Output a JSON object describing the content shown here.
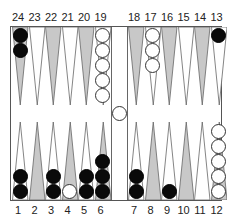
{
  "game": "Backgammon",
  "colors": {
    "light_point": "#ffffff",
    "dark_point": "#c8c8c8",
    "black_checker": "#0a0a0a",
    "white_checker": "#ffffff",
    "board_border": "#555555"
  },
  "labels": {
    "top": [
      "24",
      "23",
      "22",
      "21",
      "20",
      "19",
      "18",
      "17",
      "16",
      "15",
      "14",
      "13"
    ],
    "bottom": [
      "1",
      "2",
      "3",
      "4",
      "5",
      "6",
      "7",
      "8",
      "9",
      "10",
      "11",
      "12"
    ]
  },
  "points": [
    {
      "point": 1,
      "color": "black",
      "count": 2
    },
    {
      "point": 2,
      "color": null,
      "count": 0
    },
    {
      "point": 3,
      "color": "black",
      "count": 2
    },
    {
      "point": 4,
      "color": "white",
      "count": 1
    },
    {
      "point": 5,
      "color": "black",
      "count": 2
    },
    {
      "point": 6,
      "color": "black",
      "count": 3
    },
    {
      "point": 7,
      "color": "black",
      "count": 2
    },
    {
      "point": 8,
      "color": null,
      "count": 0
    },
    {
      "point": 9,
      "color": "black",
      "count": 1
    },
    {
      "point": 10,
      "color": null,
      "count": 0
    },
    {
      "point": 11,
      "color": null,
      "count": 0
    },
    {
      "point": 12,
      "color": "white",
      "count": 5
    },
    {
      "point": 13,
      "color": "black",
      "count": 1
    },
    {
      "point": 14,
      "color": null,
      "count": 0
    },
    {
      "point": 15,
      "color": null,
      "count": 0
    },
    {
      "point": 16,
      "color": null,
      "count": 0
    },
    {
      "point": 17,
      "color": "white",
      "count": 3
    },
    {
      "point": 18,
      "color": null,
      "count": 0
    },
    {
      "point": 19,
      "color": "white",
      "count": 5
    },
    {
      "point": 20,
      "color": null,
      "count": 0
    },
    {
      "point": 21,
      "color": null,
      "count": 0
    },
    {
      "point": 22,
      "color": null,
      "count": 0
    },
    {
      "point": 23,
      "color": null,
      "count": 0
    },
    {
      "point": 24,
      "color": "black",
      "count": 2
    }
  ],
  "bar": {
    "white": 1,
    "black": 0
  }
}
